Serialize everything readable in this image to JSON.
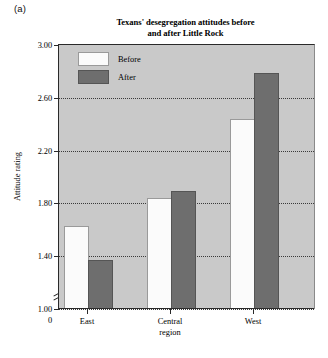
{
  "panel_label": "(a)",
  "chart_data": {
    "type": "bar",
    "title": "Texans' desegregation attitudes before and after Little Rock",
    "title_lines": [
      "Texans' desegregation attitudes before",
      "and after Little Rock"
    ],
    "xlabel": "",
    "ylabel": "Attitude rating",
    "categories": [
      "East",
      "Central region",
      "West"
    ],
    "category_lines": [
      [
        "East"
      ],
      [
        "Central",
        "region"
      ],
      [
        "West"
      ]
    ],
    "series": [
      {
        "name": "Before",
        "values": [
          1.62,
          1.83,
          2.43
        ],
        "color": "#fbfbfb"
      },
      {
        "name": "After",
        "values": [
          1.36,
          1.89,
          2.78
        ],
        "color": "#6e6e6e"
      }
    ],
    "ylim": [
      1.0,
      3.0
    ],
    "yticks": [
      1.0,
      1.4,
      1.8,
      2.2,
      2.6,
      3.0
    ],
    "ytick_labels": [
      "1.00",
      "1.40",
      "1.80",
      "2.20",
      "2.60",
      "3.00"
    ],
    "origin_label": "0",
    "axis_break": true,
    "grid": true,
    "legend_position": "top-left-inside",
    "plot_background": "#c9c9c9"
  }
}
